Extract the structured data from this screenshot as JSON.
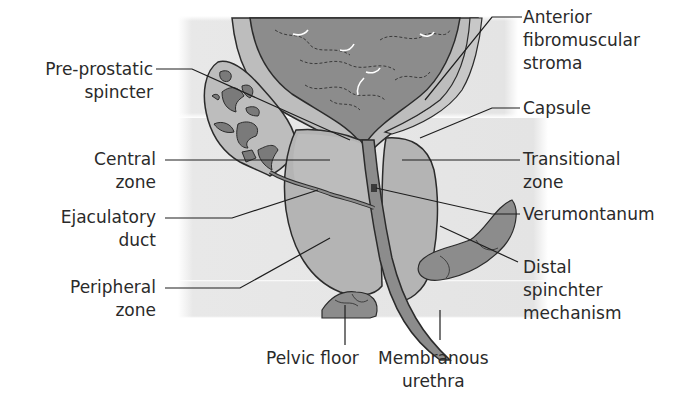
{
  "diagram": {
    "colors": {
      "background_panel": "#e6e6e6",
      "bladder": "#8c8c8c",
      "gland": "#b4b4b4",
      "seminal_vesicle_ducts": "#7a7a7a",
      "outline": "#2b2b2b",
      "leader_line": "#1e1e1e",
      "text": "#2a2a2a"
    },
    "labels": {
      "pre_prostatic": {
        "line1": "Pre-prostatic",
        "line2": "spincter"
      },
      "central_zone": {
        "line1": "Central",
        "line2": "zone"
      },
      "ejaculatory_duct": {
        "line1": "Ejaculatory",
        "line2": "duct"
      },
      "peripheral_zone": {
        "line1": "Peripheral",
        "line2": "zone"
      },
      "pelvic_floor": {
        "line1": "Pelvic floor"
      },
      "membranous_urethra": {
        "line1": "Membranous",
        "line2": "urethra"
      },
      "anterior_fibromuscular": {
        "line1": "Anterior",
        "line2": "fibromuscular",
        "line3": "stroma"
      },
      "capsule": {
        "line1": "Capsule"
      },
      "transitional_zone": {
        "line1": "Transitional",
        "line2": "zone"
      },
      "verumontanum": {
        "line1": "Verumontanum"
      },
      "distal_sphincter": {
        "line1": "Distal",
        "line2": "spinchter",
        "line3": "mechanism"
      }
    }
  }
}
